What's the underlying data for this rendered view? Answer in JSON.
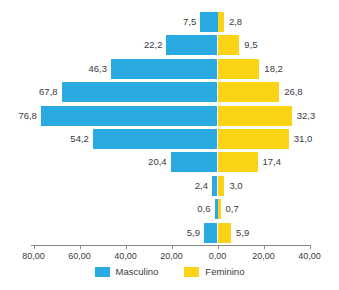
{
  "chart_data": {
    "type": "bar",
    "subtype": "population-pyramid",
    "title": "",
    "xlabel": "",
    "ylabel": "",
    "orientation": "horizontal",
    "grid": false,
    "legend_position": "bottom",
    "zero_at": 0.0,
    "axis_ticks": [
      {
        "label": "80,00",
        "value": -80
      },
      {
        "label": "60,00",
        "value": -60
      },
      {
        "label": "40,00",
        "value": -40
      },
      {
        "label": "20,00",
        "value": -20
      },
      {
        "label": "0,00",
        "value": 0
      },
      {
        "label": "20,00",
        "value": 20
      },
      {
        "label": "40,00",
        "value": 40
      }
    ],
    "xlim": [
      -80,
      40
    ],
    "categories": [
      "1",
      "2",
      "3",
      "4",
      "5",
      "6",
      "7",
      "8",
      "9",
      "10"
    ],
    "series": [
      {
        "name": "Masculino",
        "color": "#29abe2",
        "direction": "left",
        "values": [
          7.5,
          22.2,
          46.3,
          67.8,
          76.8,
          54.2,
          20.4,
          2.4,
          0.6,
          5.9
        ],
        "labels": [
          "7,5",
          "22,2",
          "46,3",
          "67,8",
          "76,8",
          "54,2",
          "20,4",
          "2,4",
          "0,6",
          "5,9"
        ]
      },
      {
        "name": "Feminino",
        "color": "#fad316",
        "direction": "right",
        "values": [
          2.8,
          9.5,
          18.2,
          26.8,
          32.3,
          31.0,
          17.4,
          3.0,
          0.7,
          5.9
        ],
        "labels": [
          "2,8",
          "9,5",
          "18,2",
          "26,8",
          "32,3",
          "31,0",
          "17,4",
          "3,0",
          "0,7",
          "5,9"
        ]
      }
    ]
  },
  "legend": {
    "items": [
      {
        "label": "Masculino",
        "color": "#29abe2"
      },
      {
        "label": "Feminino",
        "color": "#fad316"
      }
    ]
  },
  "colors": {
    "male": "#29abe2",
    "female": "#fad316",
    "axis": "#8a8a8a",
    "text": "#3b3b3b",
    "background": "#ffffff"
  }
}
